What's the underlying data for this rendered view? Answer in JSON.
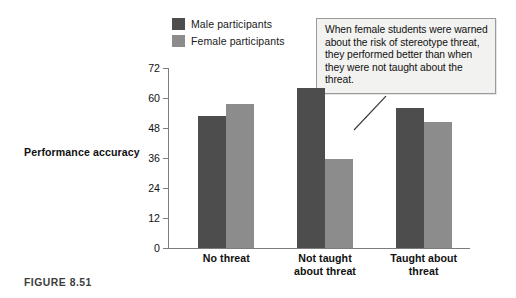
{
  "figure": {
    "caption": "FIGURE 8.51"
  },
  "callout": {
    "text": "When female students were warned about the risk of stereotype threat, they performed better than when they were not taught about the threat."
  },
  "colors": {
    "male_bar": "#4d4d4d",
    "female_bar": "#8c8c8c",
    "axis": "#7c7c7c",
    "callout_bg": "#f2f2f0",
    "callout_border": "#9a9a9a",
    "text": "#111111",
    "caption": "#3d3d3d"
  },
  "chart_data": {
    "type": "bar",
    "title": "",
    "xlabel": "",
    "ylabel": "Performance accuracy",
    "ylim": [
      0,
      72
    ],
    "yticks": [
      0,
      12,
      24,
      36,
      48,
      60,
      72
    ],
    "ytick_labels": [
      "0",
      "12",
      "24",
      "36",
      "48",
      "60",
      "72"
    ],
    "grid": false,
    "legend_position": "top-left",
    "categories": [
      "No threat",
      "Not taught about threat",
      "Taught about threat"
    ],
    "category_lines": [
      [
        "No threat"
      ],
      [
        "Not taught",
        "about threat"
      ],
      [
        "Taught about",
        "threat"
      ]
    ],
    "series": [
      {
        "name": "Male participants",
        "color": "#4d4d4d",
        "values": [
          53,
          64,
          56
        ]
      },
      {
        "name": "Female participants",
        "color": "#8c8c8c",
        "values": [
          57.5,
          35.5,
          50.5
        ]
      }
    ]
  }
}
